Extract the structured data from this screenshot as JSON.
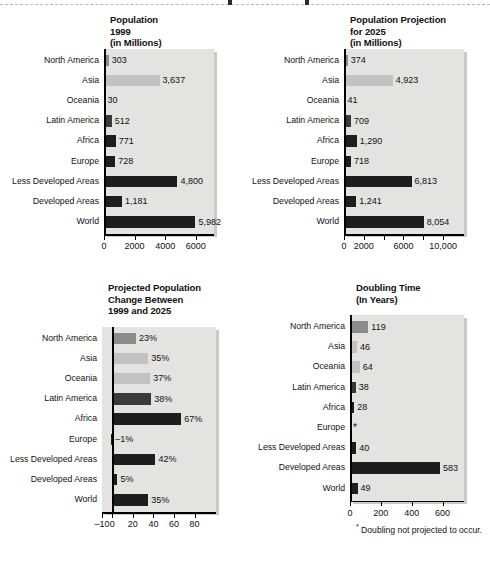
{
  "page": {
    "background": "#ffffff",
    "categories": [
      "North America",
      "Asia",
      "Oceania",
      "Latin America",
      "Africa",
      "Europe",
      "Less Developed Areas",
      "Developed Areas",
      "World"
    ]
  },
  "colors": {
    "plot_background": "#e3e3e1",
    "plot_shadow": "#c9c9c7",
    "bar_medium": "#8c8c8c",
    "bar_light": "#c2c2c2",
    "bar_dark": "#3a3a3a",
    "bar_black": "#1d1d1d",
    "axis": "#000000",
    "text": "#111111"
  },
  "chart_data": [
    {
      "id": "population-1999",
      "type": "bar",
      "orientation": "horizontal",
      "title": "Population\n1999\n(in Millions)",
      "title_lines": [
        "Population",
        "1999",
        "(in Millions)"
      ],
      "xlabel": "",
      "ylabel": "",
      "xlim": [
        0,
        6800
      ],
      "ticks": [
        0,
        2000,
        4000,
        6000
      ],
      "tick_labels": [
        "0",
        "2000",
        "4000",
        "6000"
      ],
      "grid": false,
      "categories": [
        "North America",
        "Asia",
        "Oceania",
        "Latin America",
        "Africa",
        "Europe",
        "Less Developed Areas",
        "Developed Areas",
        "World"
      ],
      "values": [
        303,
        3637,
        30,
        512,
        771,
        728,
        4800,
        1181,
        5982
      ],
      "value_labels": [
        "303",
        "3,637",
        "30",
        "512",
        "771",
        "728",
        "4,800",
        "1,181",
        "5,982"
      ],
      "bar_shades": [
        "medium",
        "light",
        "light",
        "dark",
        "black",
        "black",
        "black",
        "black",
        "black"
      ]
    },
    {
      "id": "population-projection-2025",
      "type": "bar",
      "orientation": "horizontal",
      "title": "Population Projection\nfor 2025\n(in Millions)",
      "title_lines": [
        "Population Projection",
        "for 2025",
        "(in Millions)"
      ],
      "xlabel": "",
      "ylabel": "",
      "xlim": [
        0,
        11500
      ],
      "ticks": [
        0,
        2000,
        4000,
        6000,
        8000,
        10000
      ],
      "tick_labels": [
        "0",
        "2000",
        "",
        "6000",
        "",
        "10,000"
      ],
      "grid": false,
      "categories": [
        "North America",
        "Asia",
        "Oceania",
        "Latin America",
        "Africa",
        "Europe",
        "Less Developed Areas",
        "Developed Areas",
        "World"
      ],
      "values": [
        374,
        4923,
        41,
        709,
        1290,
        718,
        6813,
        1241,
        8054
      ],
      "value_labels": [
        "374",
        "4,923",
        "41",
        "709",
        "1,290",
        "718",
        "6,813",
        "1,241",
        "8,054"
      ],
      "bar_shades": [
        "medium",
        "light",
        "light",
        "dark",
        "black",
        "black",
        "black",
        "black",
        "black"
      ]
    },
    {
      "id": "projected-population-change",
      "type": "bar",
      "orientation": "horizontal",
      "title": "Projected Population\nChange Between\n1999 and 2025",
      "title_lines": [
        "Projected Population",
        "Change Between",
        "1999 and 2025"
      ],
      "xlabel": "",
      "ylabel": "",
      "xlim": [
        -10,
        95
      ],
      "ticks": [
        -10,
        0,
        20,
        40,
        60,
        80
      ],
      "tick_labels": [
        "–10",
        "0",
        "20",
        "40",
        "60",
        "80"
      ],
      "grid": false,
      "categories": [
        "North America",
        "Asia",
        "Oceania",
        "Latin America",
        "Africa",
        "Europe",
        "Less Developed Areas",
        "Developed Areas",
        "World"
      ],
      "values": [
        23,
        35,
        37,
        38,
        67,
        -1,
        42,
        5,
        35
      ],
      "value_labels": [
        "23%",
        "35%",
        "37%",
        "38%",
        "67%",
        "–1%",
        "42%",
        "5%",
        "35%"
      ],
      "bar_shades": [
        "medium",
        "light",
        "light",
        "dark",
        "black",
        "black",
        "black",
        "black",
        "black"
      ]
    },
    {
      "id": "doubling-time",
      "type": "bar",
      "orientation": "horizontal",
      "title": "Doubling Time\n(In Years)",
      "title_lines": [
        "Doubling Time",
        "(In Years)"
      ],
      "xlabel": "",
      "ylabel": "",
      "xlim": [
        0,
        700
      ],
      "ticks": [
        0,
        200,
        400,
        600
      ],
      "tick_labels": [
        "0",
        "200",
        "400",
        "600"
      ],
      "grid": false,
      "categories": [
        "North America",
        "Asia",
        "Oceania",
        "Latin America",
        "Africa",
        "Europe",
        "Less Developed Areas",
        "Developed Areas",
        "World"
      ],
      "values": [
        119,
        46,
        64,
        38,
        28,
        null,
        40,
        583,
        49
      ],
      "value_labels": [
        "119",
        "46",
        "64",
        "38",
        "28",
        "*",
        "40",
        "583",
        "49"
      ],
      "bar_shades": [
        "medium",
        "light",
        "light",
        "dark",
        "black",
        "black",
        "black",
        "black",
        "black"
      ],
      "footnote": "Doubling not projected to occur.",
      "footnote_marker": "*"
    }
  ]
}
